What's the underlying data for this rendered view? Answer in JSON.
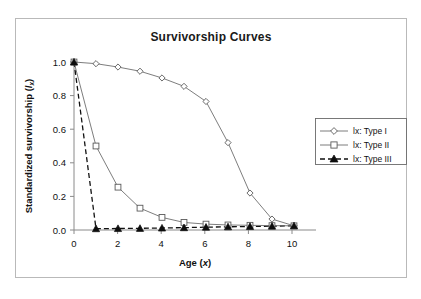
{
  "figure": {
    "title": "Survivorship Curves"
  },
  "chart_data": {
    "type": "line",
    "title": "Survivorship Curves",
    "xlabel": "Age (x)",
    "xlabel_main": "Age (",
    "xlabel_italic": "x",
    "xlabel_tail": ")",
    "ylabel": "Standardized survivorship (lx)",
    "ylabel_main": "Standardized survivorship (",
    "ylabel_italic": "l",
    "ylabel_sub": "x",
    "ylabel_tail": ")",
    "xlim": [
      0,
      11
    ],
    "ylim": [
      0,
      1.0
    ],
    "grid": false,
    "legend_position": "right",
    "x": [
      0,
      1,
      2,
      3,
      4,
      5,
      6,
      7,
      8,
      9,
      10
    ],
    "xticks": [
      0,
      2,
      4,
      6,
      8,
      10
    ],
    "xtick_labels": [
      "0",
      "2",
      "4",
      "6",
      "8",
      "10"
    ],
    "yticks": [
      0.0,
      0.2,
      0.4,
      0.6,
      0.8,
      1.0
    ],
    "ytick_labels": [
      "0.0",
      "0.2",
      "0.4",
      "0.6",
      "0.8",
      "1.0"
    ],
    "series": [
      {
        "name": "lx: Type I",
        "marker": "diamond-open",
        "linestyle": "solid",
        "values": [
          1.0,
          0.99,
          0.97,
          0.945,
          0.905,
          0.855,
          0.765,
          0.52,
          0.22,
          0.065,
          0.025
        ]
      },
      {
        "name": "lx: Type II",
        "marker": "square-open",
        "linestyle": "solid",
        "values": [
          1.0,
          0.5,
          0.255,
          0.13,
          0.075,
          0.045,
          0.035,
          0.03,
          0.028,
          0.026,
          0.025
        ]
      },
      {
        "name": "lx: Type III",
        "marker": "triangle-solid",
        "linestyle": "dashed",
        "values": [
          1.0,
          0.008,
          0.009,
          0.01,
          0.012,
          0.014,
          0.017,
          0.019,
          0.021,
          0.023,
          0.025
        ]
      }
    ]
  },
  "legend": {
    "entries": [
      {
        "label": "lx: Type I"
      },
      {
        "label": "lx: Type II"
      },
      {
        "label": "lx: Type III"
      }
    ]
  }
}
